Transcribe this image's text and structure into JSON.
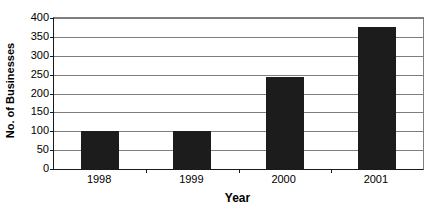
{
  "chart_data": {
    "type": "bar",
    "title": "",
    "categories": [
      "1998",
      "1999",
      "2000",
      "2001"
    ],
    "values": [
      100,
      100,
      243,
      375
    ],
    "series": [
      {
        "name": "No. of Businesses",
        "values": [
          100,
          100,
          243,
          375
        ]
      }
    ],
    "xlabel": "Year",
    "ylabel": "No. of Businesses",
    "ylim": [
      0,
      400
    ],
    "ytick_values": [
      0,
      50,
      100,
      150,
      200,
      250,
      300,
      350,
      400
    ],
    "ytick_labels": [
      "0",
      "50",
      "100",
      "150",
      "200",
      "250",
      "300",
      "350",
      "400"
    ],
    "grid": true,
    "legend": false,
    "legend_position": "none",
    "bar_color": "#1c1c1c",
    "gridline_color": "#7d7d7d",
    "axis_color": "#1a1a1a",
    "plot_background": "#ffffff"
  }
}
